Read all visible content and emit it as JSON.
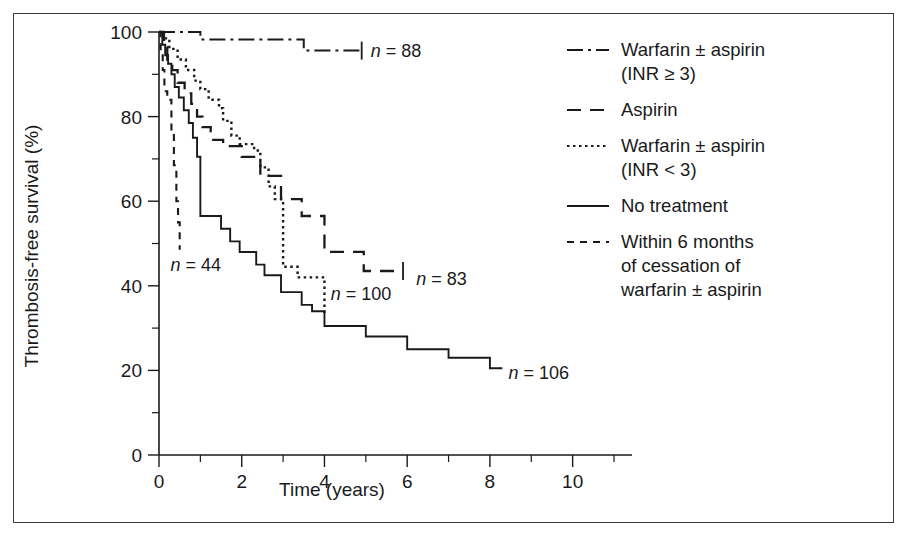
{
  "figure": {
    "border_color": "#3a3a3a",
    "background": "#ffffff",
    "ink_color": "#1a1a1a"
  },
  "chart_data": {
    "type": "line",
    "title": "",
    "xlabel": "Time (years)",
    "ylabel": "Thrombosis-free survival (%)",
    "xlim": [
      0,
      11
    ],
    "ylim": [
      0,
      100
    ],
    "grid": false,
    "legend_position": "right",
    "x_ticks_major": [
      0,
      2,
      4,
      6,
      8,
      10
    ],
    "x_ticks_minor": [
      1,
      3,
      5,
      7,
      9,
      11
    ],
    "x_tick_labels": [
      "0",
      "2",
      "4",
      "6",
      "8",
      "10"
    ],
    "y_ticks_major": [
      0,
      20,
      40,
      60,
      80,
      100
    ],
    "y_ticks_minor": [
      10,
      30,
      50,
      70,
      90
    ],
    "y_tick_labels": [
      "0",
      "20",
      "40",
      "60",
      "80",
      "100"
    ],
    "series": [
      {
        "name": "Warfarin ± aspirin (INR ≥ 3)",
        "key": "warfarin_high_inr",
        "line_style": "dash-dot",
        "dash_array": "16,5,3,5",
        "stroke_width": 2.0,
        "n": 88,
        "n_label": "n = 88",
        "n_label_x": 5.12,
        "n_label_y": 95.5,
        "end_censor": true,
        "steps": [
          [
            0.0,
            100
          ],
          [
            1.0,
            100
          ],
          [
            1.0,
            98.2
          ],
          [
            3.5,
            98.2
          ],
          [
            3.5,
            95.6
          ],
          [
            4.9,
            95.6
          ]
        ]
      },
      {
        "name": "Aspirin",
        "key": "aspirin",
        "line_style": "dashed-long",
        "dash_array": "14,9",
        "stroke_width": 2.3,
        "n": 83,
        "n_label": "n = 83",
        "n_label_x": 6.22,
        "n_label_y": 41.5,
        "end_censor": true,
        "steps": [
          [
            0.0,
            100
          ],
          [
            0.12,
            100
          ],
          [
            0.12,
            96.5
          ],
          [
            0.2,
            96.5
          ],
          [
            0.2,
            93.5
          ],
          [
            0.32,
            93.5
          ],
          [
            0.32,
            91.0
          ],
          [
            0.45,
            91.0
          ],
          [
            0.45,
            88.0
          ],
          [
            0.62,
            88.0
          ],
          [
            0.62,
            85.5
          ],
          [
            0.78,
            85.5
          ],
          [
            0.78,
            83.0
          ],
          [
            0.92,
            83.0
          ],
          [
            0.92,
            80.0
          ],
          [
            1.05,
            80.0
          ],
          [
            1.05,
            77.5
          ],
          [
            1.25,
            77.5
          ],
          [
            1.25,
            74.5
          ],
          [
            1.55,
            74.5
          ],
          [
            1.55,
            73.0
          ],
          [
            2.0,
            73.0
          ],
          [
            2.0,
            70.5
          ],
          [
            2.45,
            70.5
          ],
          [
            2.45,
            66.0
          ],
          [
            2.95,
            66.0
          ],
          [
            2.95,
            60.5
          ],
          [
            3.45,
            60.5
          ],
          [
            3.45,
            56.5
          ],
          [
            4.0,
            56.5
          ],
          [
            4.0,
            48.0
          ],
          [
            4.95,
            48.0
          ],
          [
            4.95,
            43.5
          ],
          [
            5.9,
            43.5
          ]
        ]
      },
      {
        "name": "Warfarin ± aspirin (INR < 3)",
        "key": "warfarin_low_inr",
        "line_style": "dotted",
        "dash_array": "2.5,3.5",
        "stroke_width": 2.4,
        "n": 100,
        "n_label": "n = 100",
        "n_label_x": 4.15,
        "n_label_y": 38.0,
        "end_censor": false,
        "steps": [
          [
            0.0,
            100
          ],
          [
            0.1,
            100
          ],
          [
            0.1,
            98.5
          ],
          [
            0.25,
            98.5
          ],
          [
            0.25,
            96.0
          ],
          [
            0.45,
            96.0
          ],
          [
            0.45,
            93.5
          ],
          [
            0.65,
            93.5
          ],
          [
            0.65,
            91.0
          ],
          [
            0.85,
            91.0
          ],
          [
            0.85,
            88.5
          ],
          [
            1.0,
            88.5
          ],
          [
            1.0,
            86.5
          ],
          [
            1.2,
            86.5
          ],
          [
            1.2,
            84.0
          ],
          [
            1.45,
            84.0
          ],
          [
            1.45,
            82.0
          ],
          [
            1.55,
            82.0
          ],
          [
            1.55,
            79.0
          ],
          [
            1.75,
            79.0
          ],
          [
            1.75,
            75.5
          ],
          [
            1.95,
            75.5
          ],
          [
            1.95,
            73.5
          ],
          [
            2.3,
            73.5
          ],
          [
            2.3,
            72.0
          ],
          [
            2.45,
            72.0
          ],
          [
            2.45,
            68.0
          ],
          [
            2.65,
            68.0
          ],
          [
            2.65,
            63.5
          ],
          [
            2.8,
            63.5
          ],
          [
            2.8,
            60.5
          ],
          [
            3.0,
            60.5
          ],
          [
            3.0,
            44.5
          ],
          [
            3.35,
            44.5
          ],
          [
            3.35,
            42.0
          ],
          [
            4.0,
            42.0
          ],
          [
            4.0,
            33.5
          ]
        ]
      },
      {
        "name": "No treatment",
        "key": "no_treatment",
        "line_style": "solid",
        "dash_array": "",
        "stroke_width": 1.9,
        "n": 106,
        "n_label": "n = 106",
        "n_label_x": 8.45,
        "n_label_y": 19.5,
        "end_censor": false,
        "steps": [
          [
            0.0,
            100
          ],
          [
            0.08,
            100
          ],
          [
            0.08,
            97.0
          ],
          [
            0.15,
            97.0
          ],
          [
            0.15,
            94.5
          ],
          [
            0.22,
            94.5
          ],
          [
            0.22,
            92.5
          ],
          [
            0.3,
            92.5
          ],
          [
            0.3,
            90.0
          ],
          [
            0.38,
            90.0
          ],
          [
            0.38,
            87.0
          ],
          [
            0.48,
            87.0
          ],
          [
            0.48,
            84.5
          ],
          [
            0.6,
            84.5
          ],
          [
            0.6,
            81.5
          ],
          [
            0.72,
            81.5
          ],
          [
            0.72,
            78.5
          ],
          [
            0.82,
            78.5
          ],
          [
            0.82,
            75.0
          ],
          [
            0.92,
            75.0
          ],
          [
            0.92,
            70.5
          ],
          [
            1.0,
            70.5
          ],
          [
            1.0,
            56.5
          ],
          [
            1.5,
            56.5
          ],
          [
            1.5,
            53.5
          ],
          [
            1.72,
            53.5
          ],
          [
            1.72,
            50.5
          ],
          [
            1.95,
            50.5
          ],
          [
            1.95,
            48.0
          ],
          [
            2.35,
            48.0
          ],
          [
            2.35,
            45.0
          ],
          [
            2.55,
            45.0
          ],
          [
            2.55,
            42.5
          ],
          [
            2.95,
            42.5
          ],
          [
            2.95,
            38.5
          ],
          [
            3.45,
            38.5
          ],
          [
            3.45,
            35.5
          ],
          [
            3.7,
            35.5
          ],
          [
            3.7,
            34.0
          ],
          [
            4.0,
            34.0
          ],
          [
            4.0,
            30.5
          ],
          [
            5.0,
            30.5
          ],
          [
            5.0,
            28.0
          ],
          [
            6.0,
            28.0
          ],
          [
            6.0,
            25.0
          ],
          [
            7.0,
            25.0
          ],
          [
            7.0,
            23.0
          ],
          [
            8.0,
            23.0
          ],
          [
            8.0,
            20.5
          ],
          [
            8.3,
            20.5
          ]
        ]
      },
      {
        "name": "Within 6 months of cessation of warfarin ± aspirin",
        "key": "within_6_months",
        "line_style": "dashed-short",
        "dash_array": "7,6",
        "stroke_width": 2.1,
        "n": 44,
        "n_label": "n = 44",
        "n_label_x": 0.28,
        "n_label_y": 45.0,
        "end_censor": false,
        "steps": [
          [
            0.0,
            100
          ],
          [
            0.04,
            100
          ],
          [
            0.04,
            95.0
          ],
          [
            0.09,
            95.0
          ],
          [
            0.09,
            91.0
          ],
          [
            0.13,
            91.0
          ],
          [
            0.13,
            86.0
          ],
          [
            0.2,
            86.0
          ],
          [
            0.2,
            84.0
          ],
          [
            0.3,
            84.0
          ],
          [
            0.3,
            76.5
          ],
          [
            0.36,
            76.5
          ],
          [
            0.36,
            68.5
          ],
          [
            0.42,
            68.5
          ],
          [
            0.42,
            60.0
          ],
          [
            0.46,
            60.0
          ],
          [
            0.46,
            55.0
          ],
          [
            0.5,
            55.0
          ],
          [
            0.5,
            48.5
          ]
        ]
      }
    ]
  },
  "legend": {
    "entries": [
      {
        "id": "legend-warfarin-high-inr",
        "dash_array": "16,5,3,5",
        "lines": [
          "Warfarin ± aspirin",
          "(INR ≥ 3)"
        ]
      },
      {
        "id": "legend-aspirin",
        "dash_array": "14,9",
        "lines": [
          "Aspirin"
        ]
      },
      {
        "id": "legend-warfarin-low-inr",
        "dash_array": "2.5,3.5",
        "lines": [
          "Warfarin ± aspirin",
          "(INR < 3)"
        ]
      },
      {
        "id": "legend-no-treatment",
        "dash_array": "",
        "lines": [
          "No treatment"
        ]
      },
      {
        "id": "legend-within-6-months",
        "dash_array": "7,6",
        "lines": [
          "Within 6 months",
          "of cessation of",
          "warfarin ± aspirin"
        ]
      }
    ]
  }
}
